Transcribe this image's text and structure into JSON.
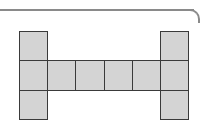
{
  "diagram": {
    "type": "cube-net",
    "square_fill": "#d4d4d4",
    "square_border": "#3a3a3a",
    "grid_columns": 6,
    "grid_rows": 3,
    "squares": [
      {
        "row": 0,
        "col": 0
      },
      {
        "row": 0,
        "col": 5
      },
      {
        "row": 1,
        "col": 0
      },
      {
        "row": 1,
        "col": 1
      },
      {
        "row": 1,
        "col": 2
      },
      {
        "row": 1,
        "col": 3
      },
      {
        "row": 1,
        "col": 4
      },
      {
        "row": 1,
        "col": 5
      },
      {
        "row": 2,
        "col": 0
      },
      {
        "row": 2,
        "col": 5
      }
    ]
  }
}
